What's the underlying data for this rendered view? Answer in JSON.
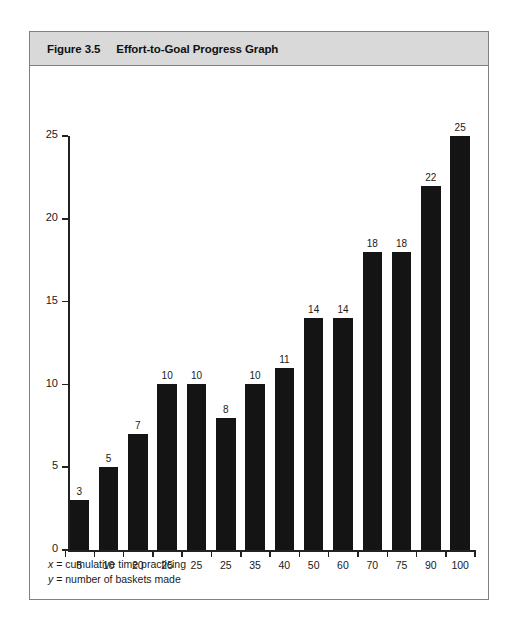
{
  "figure": {
    "number": "Figure 3.5",
    "title": "Effort-to-Goal Progress Graph",
    "notes": [
      {
        "variable": "x",
        "text": " = cumulative time practicing"
      },
      {
        "variable": "y",
        "text": " = number of baskets made"
      }
    ]
  },
  "colors": {
    "bar": "#141414",
    "header_bar": "#d9d9d9",
    "border": "#808080",
    "axis": "#222222",
    "text": "#1a1a1a"
  },
  "chart_data": {
    "type": "bar",
    "title": "Effort-to-Goal Progress Graph",
    "xlabel": "x = cumulative time practicing",
    "ylabel": "y = number of baskets made",
    "categories": [
      "5",
      "10",
      "20",
      "25",
      "25",
      "25",
      "35",
      "40",
      "50",
      "60",
      "70",
      "75",
      "90",
      "100"
    ],
    "values": [
      3,
      5,
      7,
      10,
      10,
      8,
      10,
      11,
      14,
      14,
      18,
      18,
      22,
      25
    ],
    "data_labels": [
      "3",
      "5",
      "7",
      "10",
      "10",
      "8",
      "10",
      "11",
      "14",
      "14",
      "18",
      "18",
      "22",
      "25"
    ],
    "ylim": [
      0,
      25
    ],
    "yticks": [
      0,
      5,
      10,
      15,
      20,
      25
    ],
    "ytick_labels": [
      "0",
      "5",
      "10",
      "15",
      "20",
      "25"
    ],
    "grid": false,
    "legend": false
  }
}
